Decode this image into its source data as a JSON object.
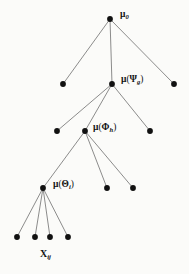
{
  "figure": {
    "type": "hierarchical-tree-diagram",
    "background_color": "#fbfbf9",
    "node_color": "#111111",
    "edge_color": "#6f6f6f",
    "width": 189,
    "height": 274
  },
  "labels": {
    "root": {
      "symbol": "μ",
      "subscript": "0",
      "text": "μ0"
    },
    "level2": {
      "symbol": "μ",
      "argument": "Ψ",
      "subscript": "g",
      "text": "μ(Ψg)"
    },
    "level3": {
      "symbol": "μ",
      "argument": "Φ",
      "subscript": "h",
      "text": "μ(Φh)"
    },
    "level4": {
      "symbol": "μ",
      "argument": "Θ",
      "subscript": "i",
      "text": "μ(Θi)"
    },
    "leaves": {
      "symbol": "X",
      "subscript": "ij",
      "text": "Xij"
    }
  },
  "chart_data": {
    "type": "tree",
    "title": "",
    "nodes": [
      {
        "id": "root",
        "x": 110,
        "y": 19,
        "level": 1,
        "label": "μ0",
        "labeled": true,
        "r": 2.9
      },
      {
        "id": "n2a",
        "x": 63,
        "y": 84,
        "level": 2,
        "label": "",
        "labeled": false,
        "r": 2.9
      },
      {
        "id": "n2b",
        "x": 112,
        "y": 84,
        "level": 2,
        "label": "μ(Ψg)",
        "labeled": true,
        "r": 2.9
      },
      {
        "id": "n2c",
        "x": 174,
        "y": 84,
        "level": 2,
        "label": "",
        "labeled": false,
        "r": 2.9
      },
      {
        "id": "n3a",
        "x": 57,
        "y": 131,
        "level": 3,
        "label": "",
        "labeled": false,
        "r": 2.9
      },
      {
        "id": "n3b",
        "x": 85,
        "y": 131,
        "level": 3,
        "label": "μ(Φh)",
        "labeled": true,
        "r": 2.9
      },
      {
        "id": "n3c",
        "x": 150,
        "y": 131,
        "level": 3,
        "label": "",
        "labeled": false,
        "r": 2.9
      },
      {
        "id": "n4a",
        "x": 43,
        "y": 188,
        "level": 4,
        "label": "μ(Θi)",
        "labeled": true,
        "r": 2.9
      },
      {
        "id": "n4b",
        "x": 107,
        "y": 188,
        "level": 4,
        "label": "",
        "labeled": false,
        "r": 2.9
      },
      {
        "id": "n4c",
        "x": 133,
        "y": 188,
        "level": 4,
        "label": "",
        "labeled": false,
        "r": 2.9
      },
      {
        "id": "n5a",
        "x": 17,
        "y": 237,
        "level": 5,
        "label": "",
        "labeled": false,
        "r": 2.9
      },
      {
        "id": "n5b",
        "x": 35,
        "y": 237,
        "level": 5,
        "label": "",
        "labeled": false,
        "r": 2.9
      },
      {
        "id": "n5c",
        "x": 50,
        "y": 237,
        "level": 5,
        "label": "",
        "labeled": false,
        "r": 2.9
      },
      {
        "id": "n5d",
        "x": 68,
        "y": 237,
        "level": 5,
        "label": "",
        "labeled": false,
        "r": 2.9
      }
    ],
    "edges": [
      {
        "from": "root",
        "to": "n2a"
      },
      {
        "from": "root",
        "to": "n2b"
      },
      {
        "from": "root",
        "to": "n2c"
      },
      {
        "from": "n2b",
        "to": "n3a"
      },
      {
        "from": "n2b",
        "to": "n3b"
      },
      {
        "from": "n2b",
        "to": "n3c"
      },
      {
        "from": "n3b",
        "to": "n4a"
      },
      {
        "from": "n3b",
        "to": "n4b"
      },
      {
        "from": "n3b",
        "to": "n4c"
      },
      {
        "from": "n4a",
        "to": "n5a"
      },
      {
        "from": "n4a",
        "to": "n5b"
      },
      {
        "from": "n4a",
        "to": "n5c"
      },
      {
        "from": "n4a",
        "to": "n5d"
      }
    ],
    "levels": 5,
    "label_positions": [
      {
        "for": "root",
        "x": 120,
        "y": 10
      },
      {
        "for": "n2b",
        "x": 121,
        "y": 75
      },
      {
        "for": "n3b",
        "x": 93,
        "y": 123
      },
      {
        "for": "n4a",
        "x": 53,
        "y": 180
      },
      {
        "for": "leaves",
        "x": 40,
        "y": 249
      }
    ]
  }
}
